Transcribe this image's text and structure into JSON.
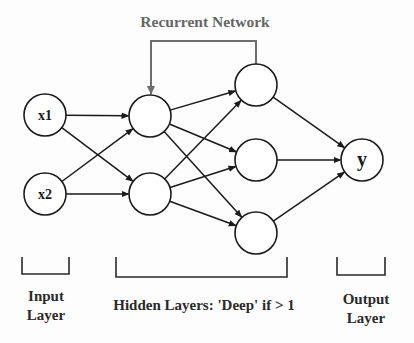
{
  "title": "Recurrent Network",
  "colors": {
    "stroke": "#1a1a1a",
    "recurrent": "#6e6e6e",
    "title": "#666666"
  },
  "nodes": {
    "input": [
      {
        "id": "x1",
        "label": "x1",
        "cx": 45,
        "cy": 115
      },
      {
        "id": "x2",
        "label": "x2",
        "cx": 45,
        "cy": 194
      }
    ],
    "hidden1": [
      {
        "id": "h1a",
        "label": "",
        "cx": 150,
        "cy": 116
      },
      {
        "id": "h1b",
        "label": "",
        "cx": 150,
        "cy": 194
      }
    ],
    "hidden2": [
      {
        "id": "h2a",
        "label": "",
        "cx": 256,
        "cy": 85
      },
      {
        "id": "h2b",
        "label": "",
        "cx": 256,
        "cy": 160
      },
      {
        "id": "h2c",
        "label": "",
        "cx": 256,
        "cy": 233
      }
    ],
    "output": [
      {
        "id": "y",
        "label": "y",
        "cx": 362,
        "cy": 160
      }
    ]
  },
  "labels": {
    "input_line1": "Input",
    "input_line2": "Layer",
    "hidden": "Hidden Layers: 'Deep' if > 1",
    "output_line1": "Output",
    "output_line2": "Layer"
  }
}
